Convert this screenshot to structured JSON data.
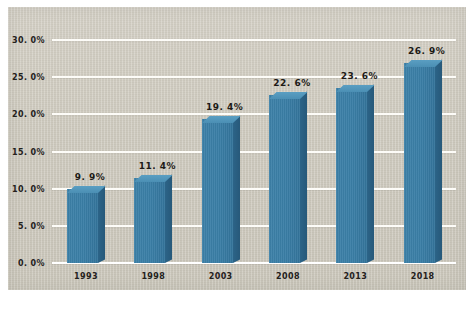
{
  "chart_data": {
    "type": "bar",
    "title": "",
    "subtitle": "",
    "xlabel": "",
    "ylabel": "",
    "categories": [
      "1993",
      "1998",
      "2003",
      "2008",
      "2013",
      "2018"
    ],
    "values": [
      9.9,
      11.4,
      19.4,
      22.6,
      23.6,
      26.9
    ],
    "value_labels": [
      "9. 9%",
      "11. 4%",
      "19. 4%",
      "22. 6%",
      "23. 6%",
      "26. 9%"
    ],
    "ylim": [
      0,
      30
    ],
    "ytick_values": [
      0,
      5,
      10,
      15,
      20,
      25,
      30
    ],
    "ytick_labels": [
      "0. 0%",
      "5. 0%",
      "10. 0%",
      "15. 0%",
      "20. 0%",
      "25. 0%",
      "30. 0%"
    ],
    "grid": true,
    "grid_axis": "y",
    "legend": false,
    "legend_position": "none",
    "style": "3d-column",
    "annotations": []
  },
  "caption": {
    "text": ""
  },
  "colors": {
    "background": "#ffffff",
    "canvas": "#cdc9bd",
    "bar_front": "#3a7ea6",
    "bar_side": "#2c6488",
    "bar_top": "#5a9ec2",
    "gridline": "#fdfcf8",
    "text": "#24211c"
  }
}
